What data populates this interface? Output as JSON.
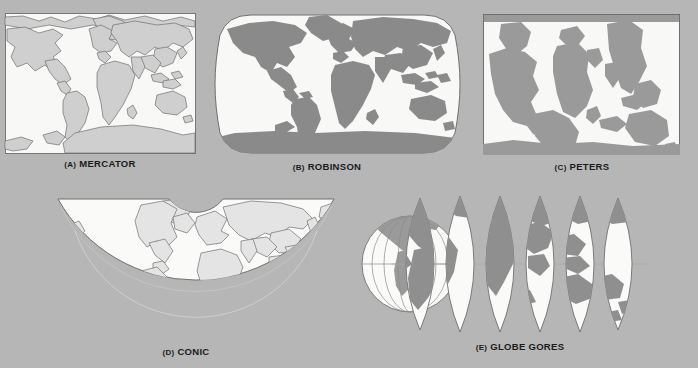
{
  "figure": {
    "background_color": "#b6b6b6",
    "land_fill_flat": "#c8c8c8",
    "land_fill_solid": "#8a8a8a",
    "ocean_fill": "#f7f7f5",
    "outline_color": "#6b6b6b",
    "caption_color": "#1b1b1b"
  },
  "panels": [
    {
      "id": "mercator",
      "index": "(A)",
      "name": "MERCATOR",
      "projection_type": "cylindrical",
      "shape": "rectangle",
      "land_style": "outline",
      "frame": {
        "x": 5,
        "y": 13,
        "w": 191,
        "h": 141
      }
    },
    {
      "id": "robinson",
      "index": "(B)",
      "name": "ROBINSON",
      "projection_type": "pseudocylindrical",
      "shape": "rounded-oval",
      "land_style": "solid",
      "frame": {
        "x": 215,
        "y": 13,
        "w": 245,
        "h": 142
      }
    },
    {
      "id": "peters",
      "index": "(C)",
      "name": "PETERS",
      "projection_type": "equal-area cylindrical",
      "shape": "rectangle",
      "land_style": "solid",
      "frame": {
        "x": 483,
        "y": 14,
        "w": 197,
        "h": 141
      }
    },
    {
      "id": "conic",
      "index": "(D)",
      "name": "CONIC",
      "projection_type": "conic",
      "shape": "fan",
      "land_style": "outline",
      "frame": {
        "x": 45,
        "y": 193,
        "w": 302,
        "h": 144
      }
    },
    {
      "id": "globe-gores",
      "index": "(E)",
      "name": "GLOBE GORES",
      "projection_type": "interrupted gores",
      "shape": "lens-strips",
      "land_style": "solid",
      "gore_count": 7,
      "frame": {
        "x": 362,
        "y": 192,
        "w": 290,
        "h": 145
      }
    }
  ],
  "captions": [
    {
      "for": "mercator",
      "index": "(A)",
      "name": "MERCATOR",
      "cx": 100,
      "y": 158
    },
    {
      "for": "robinson",
      "index": "(B)",
      "name": "ROBINSON",
      "cx": 327,
      "y": 161
    },
    {
      "for": "peters",
      "index": "(C)",
      "name": "PETERS",
      "cx": 582,
      "y": 161
    },
    {
      "for": "conic",
      "index": "(D)",
      "name": "CONIC",
      "cx": 186,
      "y": 346
    },
    {
      "for": "globe-gores",
      "index": "(E)",
      "name": "GLOBE GORES",
      "cx": 520,
      "y": 341
    }
  ]
}
